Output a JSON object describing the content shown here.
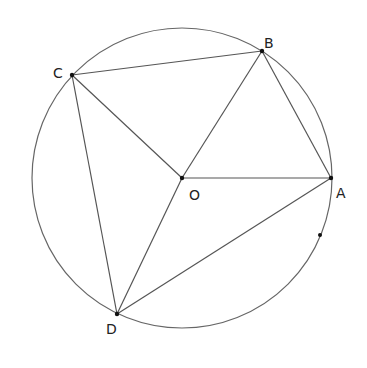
{
  "diagram": {
    "type": "circle-geometry",
    "circle": {
      "center": "O",
      "cx": 182,
      "cy": 178,
      "r": 150
    },
    "points": {
      "O": {
        "x": 182,
        "y": 178,
        "label": "O",
        "lx": 189,
        "ly": 200
      },
      "A": {
        "x": 331,
        "y": 178,
        "label": "A",
        "lx": 336,
        "ly": 198
      },
      "B": {
        "x": 262,
        "y": 51,
        "label": "B",
        "lx": 264,
        "ly": 48
      },
      "C": {
        "x": 72,
        "y": 75,
        "label": "C",
        "lx": 53,
        "ly": 78
      },
      "D": {
        "x": 117,
        "y": 314,
        "label": "D",
        "lx": 106,
        "ly": 334
      },
      "E": {
        "x": 320,
        "y": 235,
        "label": ""
      }
    },
    "segments": [
      [
        "C",
        "B"
      ],
      [
        "B",
        "A"
      ],
      [
        "O",
        "A"
      ],
      [
        "O",
        "B"
      ],
      [
        "O",
        "C"
      ],
      [
        "O",
        "D"
      ],
      [
        "C",
        "D"
      ],
      [
        "D",
        "A"
      ]
    ],
    "labels": {
      "O": "O",
      "A": "A",
      "B": "B",
      "C": "C",
      "D": "D"
    }
  }
}
